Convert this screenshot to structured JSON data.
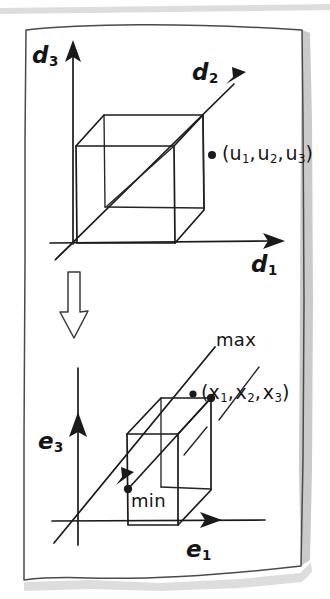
{
  "figure": {
    "medium": "hand-drawn ink sketch on paper",
    "ink_color": "#1a1a1a",
    "paper_color": "#ffffff",
    "shadow_color": "#b8b8b8"
  },
  "top_panel": {
    "name": "d-space unit cube",
    "axes": [
      {
        "id": "d3",
        "label": "d",
        "subscript": "3",
        "direction": "up",
        "arrowhead": "solid-triangle"
      },
      {
        "id": "d2",
        "label": "d",
        "subscript": "2",
        "direction": "up-right-diagonal",
        "arrowhead": "solid-triangle"
      },
      {
        "id": "d1",
        "label": "d",
        "subscript": "1",
        "direction": "right",
        "arrowhead": "solid-triangle"
      }
    ],
    "shape": "cube",
    "point": {
      "marker": "filled-dot",
      "label_open": "(",
      "components": [
        {
          "symbol": "u",
          "subscript": "1"
        },
        {
          "symbol": "u",
          "subscript": "2"
        },
        {
          "symbol": "u",
          "subscript": "3"
        }
      ],
      "label_close": ")",
      "label_text": "(u1, u2, u3)"
    }
  },
  "connector": {
    "name": "transformation-arrow",
    "style": "hollow outline arrow",
    "direction": "down"
  },
  "bottom_panel": {
    "name": "e-space bounding box",
    "axes": [
      {
        "id": "e3",
        "label": "e",
        "subscript": "3",
        "direction": "up",
        "arrowhead": "solid-triangle"
      },
      {
        "id": "e2",
        "label": "",
        "subscript": "",
        "direction": "up-right-diagonal",
        "arrowhead": "solid-triangle"
      },
      {
        "id": "e1",
        "label": "e",
        "subscript": "1",
        "direction": "right",
        "arrowhead": "solid-triangle"
      }
    ],
    "shape": "rectangular box",
    "point": {
      "marker": "filled-dot",
      "label_open": "(",
      "components": [
        {
          "symbol": "x",
          "subscript": "1"
        },
        {
          "symbol": "x",
          "subscript": "2"
        },
        {
          "symbol": "x",
          "subscript": "3"
        }
      ],
      "label_close": ")",
      "label_text": "(x1, x2, x3)"
    },
    "corners": [
      {
        "id": "max",
        "label": "max",
        "marker": "filled-dot",
        "position": "top-rear-right"
      },
      {
        "id": "min",
        "label": "min",
        "marker": "filled-dot",
        "position": "bottom-front-left"
      }
    ]
  }
}
